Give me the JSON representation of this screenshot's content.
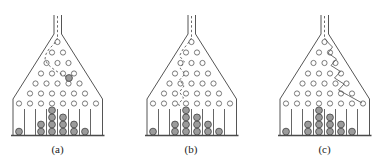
{
  "figure": {
    "type": "galton-board-diagram",
    "colors": {
      "line": "#555555",
      "floor": "#4a4a4a",
      "peg_stroke": "#6b6b6b",
      "peg_fill": "#ffffff",
      "ball_fill": "#9b9b9b",
      "ball_stroke": "#4d4d4d",
      "trajectory": "#5a5a5a",
      "label_color": "#222222"
    },
    "board": {
      "channel": {
        "left_x": 50,
        "right_x": 57.5,
        "top_y": 13,
        "bottom_y": 32
      },
      "channel_line": [
        [
          53.5,
          14
        ],
        [
          53.5,
          36
        ]
      ],
      "hopper": {
        "left_bottom_x": 9,
        "right_bottom_x": 98.5,
        "flare_bottom_y": 97,
        "wall_bottom_y": 133
      },
      "floor": {
        "x1": 7,
        "x2": 100.5,
        "y": 133.5
      },
      "peg_rows": [
        {
          "y": 40.0,
          "x": [
            53.5
          ]
        },
        {
          "y": 50.5,
          "x": [
            48,
            59
          ]
        },
        {
          "y": 61.0,
          "x": [
            42.5,
            53.5,
            64.5
          ]
        },
        {
          "y": 71.5,
          "x": [
            37,
            48,
            59,
            70
          ]
        },
        {
          "y": 81.5,
          "x": [
            31.5,
            42.5,
            53.5,
            64.5,
            75.5
          ]
        },
        {
          "y": 91.5,
          "x": [
            26,
            37,
            48,
            59,
            70,
            81
          ]
        },
        {
          "y": 101.5,
          "x": [
            15,
            26,
            37,
            48,
            59,
            70,
            81,
            92
          ]
        }
      ],
      "peg_radius": 2.6,
      "dividers": {
        "x": [
          20.5,
          31.5,
          42.5,
          53.5,
          64.5,
          75.5,
          86.5
        ],
        "y1": 107,
        "y2": 133
      },
      "bin_centers": [
        15,
        26,
        37,
        48,
        59,
        70,
        81,
        92
      ],
      "ball_radius": 3.4,
      "ball_stack_bottom_y": 129.6,
      "ball_stack_step": 7.1
    },
    "panels": [
      {
        "label": "(a)",
        "trajectory_style": "dashed",
        "trajectory": [
          [
            53.5,
            36
          ],
          [
            50,
            42
          ],
          [
            45,
            47
          ],
          [
            42,
            52
          ],
          [
            41,
            57
          ],
          [
            43.5,
            62
          ],
          [
            48,
            66
          ],
          [
            53,
            69.5
          ],
          [
            58,
            72.5
          ],
          [
            62,
            74.5
          ]
        ],
        "falling_ball": [
          65,
          76
        ],
        "bins": [
          1,
          0,
          2,
          4,
          3,
          2,
          1,
          0
        ]
      },
      {
        "label": "(b)",
        "trajectory_style": "dashed",
        "trajectory": [
          [
            53.5,
            36
          ],
          [
            49.5,
            42
          ],
          [
            44.5,
            48
          ],
          [
            41.5,
            54
          ],
          [
            46.5,
            60
          ],
          [
            42,
            66
          ],
          [
            47,
            72
          ],
          [
            41.5,
            78
          ],
          [
            46,
            84
          ],
          [
            41.5,
            90
          ],
          [
            45.5,
            96
          ],
          [
            40.5,
            102
          ],
          [
            42.5,
            106
          ]
        ],
        "falling_ball": null,
        "bins": [
          1,
          0,
          2,
          4,
          3,
          2,
          1,
          0
        ]
      },
      {
        "label": "(c)",
        "trajectory_style": "solid",
        "trajectory": [
          [
            53.5,
            36
          ],
          [
            57.5,
            41
          ],
          [
            61.5,
            45
          ],
          [
            57,
            51
          ],
          [
            65.5,
            57
          ],
          [
            60,
            63.5
          ],
          [
            69.5,
            69.5
          ],
          [
            63.5,
            76
          ],
          [
            73,
            82
          ],
          [
            67.5,
            88
          ],
          [
            77.5,
            93.5
          ],
          [
            91,
            101
          ]
        ],
        "falling_ball": null,
        "bins": [
          1,
          0,
          2,
          4,
          3,
          2,
          1,
          0
        ]
      }
    ]
  }
}
